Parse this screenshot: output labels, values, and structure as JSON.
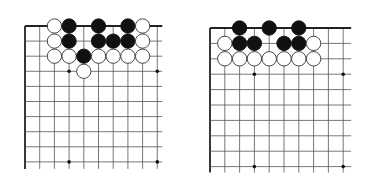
{
  "figure": {
    "type": "go-diagram-pair",
    "colors": {
      "background": "#ffffff",
      "line": "#555555",
      "edge": "#222222",
      "black": "#111111",
      "white": "#ffffff",
      "white_outline": "#333333",
      "hoshi": "#111111"
    }
  },
  "boards": [
    {
      "id": "left",
      "origin": [
        25,
        26
      ],
      "spacing": [
        14.7,
        15.1
      ],
      "cols": 10,
      "rows": 10,
      "extend_right": 5,
      "extend_down": 7,
      "edges": [
        "top",
        "left"
      ],
      "hoshi": [
        [
          3,
          3
        ],
        [
          9,
          3
        ],
        [
          3,
          9
        ],
        [
          9,
          9
        ]
      ],
      "stones": [
        {
          "col": 2,
          "row": 0,
          "color": "white"
        },
        {
          "col": 3,
          "row": 0,
          "color": "black"
        },
        {
          "col": 5,
          "row": 0,
          "color": "black"
        },
        {
          "col": 7,
          "row": 0,
          "color": "black"
        },
        {
          "col": 8,
          "row": 0,
          "color": "white"
        },
        {
          "col": 2,
          "row": 1,
          "color": "white"
        },
        {
          "col": 3,
          "row": 1,
          "color": "black"
        },
        {
          "col": 5,
          "row": 1,
          "color": "black"
        },
        {
          "col": 6,
          "row": 1,
          "color": "black"
        },
        {
          "col": 7,
          "row": 1,
          "color": "black"
        },
        {
          "col": 8,
          "row": 1,
          "color": "white"
        },
        {
          "col": 2,
          "row": 2,
          "color": "white"
        },
        {
          "col": 3,
          "row": 2,
          "color": "white"
        },
        {
          "col": 4,
          "row": 2,
          "color": "black"
        },
        {
          "col": 5,
          "row": 2,
          "color": "white"
        },
        {
          "col": 6,
          "row": 2,
          "color": "white"
        },
        {
          "col": 7,
          "row": 2,
          "color": "white"
        },
        {
          "col": 8,
          "row": 2,
          "color": "white"
        },
        {
          "col": 4,
          "row": 3,
          "color": "white"
        }
      ]
    },
    {
      "id": "right",
      "origin": [
        210,
        28
      ],
      "spacing": [
        14.8,
        15.4
      ],
      "cols": 10,
      "rows": 10,
      "extend_right": 8,
      "extend_down": 6,
      "edges": [
        "top",
        "left"
      ],
      "hoshi": [
        [
          3,
          3
        ],
        [
          9,
          3
        ],
        [
          3,
          9
        ],
        [
          9,
          9
        ]
      ],
      "stones": [
        {
          "col": 2,
          "row": 0,
          "color": "black"
        },
        {
          "col": 4,
          "row": 0,
          "color": "black"
        },
        {
          "col": 6,
          "row": 0,
          "color": "black"
        },
        {
          "col": 1,
          "row": 1,
          "color": "white"
        },
        {
          "col": 2,
          "row": 1,
          "color": "black"
        },
        {
          "col": 3,
          "row": 1,
          "color": "black"
        },
        {
          "col": 5,
          "row": 1,
          "color": "black"
        },
        {
          "col": 6,
          "row": 1,
          "color": "black"
        },
        {
          "col": 7,
          "row": 1,
          "color": "white"
        },
        {
          "col": 1,
          "row": 2,
          "color": "white"
        },
        {
          "col": 2,
          "row": 2,
          "color": "white"
        },
        {
          "col": 3,
          "row": 2,
          "color": "white"
        },
        {
          "col": 4,
          "row": 2,
          "color": "white"
        },
        {
          "col": 5,
          "row": 2,
          "color": "white"
        },
        {
          "col": 6,
          "row": 2,
          "color": "white"
        },
        {
          "col": 7,
          "row": 2,
          "color": "white"
        }
      ]
    }
  ]
}
